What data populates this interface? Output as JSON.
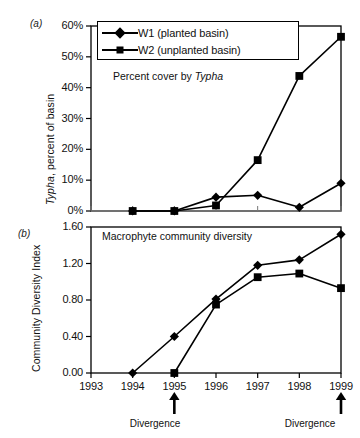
{
  "figure": {
    "panel_a_tag": "(a)",
    "panel_b_tag": "(b)"
  },
  "legend": {
    "entries": [
      {
        "label": "W1 (planted basin)",
        "marker": "diamond",
        "color": "#000000"
      },
      {
        "label": "W2 (unplanted basin)",
        "marker": "square",
        "color": "#000000"
      }
    ]
  },
  "annotations": {
    "panel_a_note": "Percent cover by Typha",
    "panel_a_note_plain": "Percent cover by ",
    "panel_a_note_italic": "Typha",
    "panel_b_note": "Macrophyte community diversity",
    "divergence_1": "Divergence",
    "divergence_2": "Divergence"
  },
  "axes": {
    "x_ticks": [
      "1993",
      "1994",
      "1995",
      "1996",
      "1997",
      "1998",
      "1999"
    ],
    "panel_a_y_ticks": [
      "0%",
      "10%",
      "20%",
      "30%",
      "40%",
      "50%",
      "60%"
    ],
    "panel_b_y_ticks": [
      "0.00",
      "0.40",
      "0.80",
      "1.20",
      "1.60"
    ],
    "panel_a_ylabel_italic": "Typha",
    "panel_a_ylabel_rest": ", percent of basin",
    "panel_b_ylabel": "Community Diversity Index"
  },
  "chart_data": [
    {
      "type": "line",
      "title": "Percent cover by Typha",
      "panel": "(a)",
      "xlabel": "",
      "ylabel": "Typha, percent of basin",
      "x": [
        1994,
        1995,
        1996,
        1997,
        1998,
        1999
      ],
      "xlim": [
        1993,
        1999
      ],
      "ylim": [
        0,
        60
      ],
      "yticks": [
        0,
        10,
        20,
        30,
        40,
        50,
        60
      ],
      "ytick_labels": [
        "0%",
        "10%",
        "20%",
        "30%",
        "40%",
        "50%",
        "60%"
      ],
      "grid": false,
      "legend_position": "top-center",
      "series": [
        {
          "name": "W1 (planted basin)",
          "marker": "diamond",
          "values": [
            0.0,
            0.0,
            4.5,
            5.1,
            1.2,
            9.0
          ]
        },
        {
          "name": "W2 (unplanted basin)",
          "marker": "square",
          "values": [
            0.0,
            0.0,
            1.8,
            16.5,
            43.8,
            56.5
          ]
        }
      ],
      "annotations": [
        "Percent cover by Typha"
      ]
    },
    {
      "type": "line",
      "title": "Macrophyte community diversity",
      "panel": "(b)",
      "xlabel": "",
      "ylabel": "Community Diversity Index",
      "x": [
        1994,
        1995,
        1996,
        1997,
        1998,
        1999
      ],
      "xlim": [
        1993,
        1999
      ],
      "ylim": [
        0.0,
        1.6
      ],
      "yticks": [
        0.0,
        0.4,
        0.8,
        1.2,
        1.6
      ],
      "ytick_labels": [
        "0.00",
        "0.40",
        "0.80",
        "1.20",
        "1.60"
      ],
      "grid": false,
      "legend_position": "none",
      "series": [
        {
          "name": "W1 (planted basin)",
          "marker": "diamond",
          "values": [
            0.0,
            0.4,
            0.81,
            1.18,
            1.24,
            1.52
          ]
        },
        {
          "name": "W2 (unplanted basin)",
          "marker": "square",
          "values": [
            null,
            0.0,
            0.75,
            1.05,
            1.09,
            0.93
          ]
        }
      ],
      "annotations": [
        "Macrophyte community diversity"
      ],
      "event_markers": [
        {
          "label": "Divergence",
          "x": 1995
        },
        {
          "label": "Divergence",
          "x": 1999
        }
      ]
    }
  ]
}
